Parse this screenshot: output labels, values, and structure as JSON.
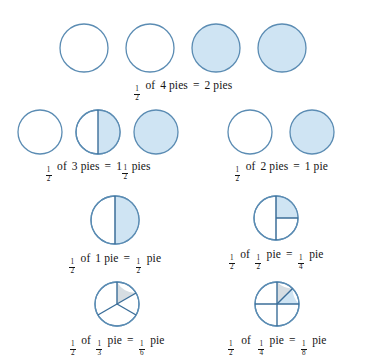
{
  "page": {
    "background_color": "#ffffff",
    "text_color": "#141414"
  },
  "style": {
    "stroke_color": "#5b8cb3",
    "divider_color": "#3b6e99",
    "fill_blue": "#cfe4f3",
    "fill_grey": "#d6dde2"
  },
  "rows": [
    {
      "id": "row-1",
      "caption": {
        "half": {
          "num": "1",
          "den": "2"
        },
        "of": "of",
        "quantity": "4 pies",
        "equals": "=",
        "result": "2 pies"
      },
      "groups": [
        {
          "id": "group-1a",
          "pies": [
            {
              "name": "pie-empty",
              "fill": "none",
              "dividers": []
            },
            {
              "name": "pie-empty",
              "fill": "none",
              "dividers": []
            },
            {
              "name": "pie-full",
              "fill": "blue",
              "dividers": []
            },
            {
              "name": "pie-full",
              "fill": "blue",
              "dividers": []
            }
          ]
        }
      ]
    },
    {
      "id": "row-2",
      "groups": [
        {
          "id": "group-2a",
          "caption": {
            "half": {
              "num": "1",
              "den": "2"
            },
            "of": "of",
            "quantity": "3 pies",
            "equals": "=",
            "result_whole": "1",
            "result_frac": {
              "num": "1",
              "den": "2"
            },
            "result_unit": "pies"
          },
          "pies": [
            {
              "name": "pie-empty",
              "fill": "none",
              "dividers": []
            },
            {
              "name": "pie-half",
              "fill": "right-half",
              "dividers": [
                "vertical"
              ]
            },
            {
              "name": "pie-full",
              "fill": "blue",
              "dividers": []
            }
          ]
        },
        {
          "id": "group-2b",
          "caption": {
            "half": {
              "num": "1",
              "den": "2"
            },
            "of": "of",
            "quantity": "2 pies",
            "equals": "=",
            "result": "1 pie"
          },
          "pies": [
            {
              "name": "pie-empty",
              "fill": "none",
              "dividers": []
            },
            {
              "name": "pie-full",
              "fill": "blue",
              "dividers": []
            }
          ]
        }
      ]
    },
    {
      "id": "row-3",
      "groups": [
        {
          "id": "group-3a",
          "caption": {
            "half": {
              "num": "1",
              "den": "2"
            },
            "of": "of",
            "quantity": "1 pie",
            "equals": "=",
            "result_frac": {
              "num": "1",
              "den": "2"
            },
            "result_unit": "pie"
          },
          "pies": [
            {
              "name": "pie-half-shaded",
              "fill": "right-half",
              "dividers": [
                "vertical"
              ]
            }
          ]
        },
        {
          "id": "group-3b",
          "caption": {
            "half": {
              "num": "1",
              "den": "2"
            },
            "of": "of",
            "quantity_frac": {
              "num": "1",
              "den": "2"
            },
            "quantity_unit": "pie",
            "equals": "=",
            "result_frac": {
              "num": "1",
              "den": "4"
            },
            "result_unit": "pie"
          },
          "pies": [
            {
              "name": "pie-quarter-shaded",
              "fill": "upper-right-quarter",
              "dividers": [
                "vertical",
                "right-horizontal"
              ]
            }
          ]
        }
      ]
    },
    {
      "id": "row-4",
      "groups": [
        {
          "id": "group-4a",
          "caption": {
            "half": {
              "num": "1",
              "den": "2"
            },
            "of": "of",
            "quantity_frac": {
              "num": "1",
              "den": "3"
            },
            "quantity_unit": "pie",
            "equals": "=",
            "result_frac": {
              "num": "1",
              "den": "6"
            },
            "result_unit": "pie"
          },
          "pies": [
            {
              "name": "pie-sixth-shaded",
              "fill": "sixth-wedge",
              "dividers": [
                "thirds",
                "sixth-split"
              ]
            }
          ]
        },
        {
          "id": "group-4b",
          "caption": {
            "half": {
              "num": "1",
              "den": "2"
            },
            "of": "of",
            "quantity_frac": {
              "num": "1",
              "den": "4"
            },
            "quantity_unit": "pie",
            "equals": "=",
            "result_frac": {
              "num": "1",
              "den": "8"
            },
            "result_unit": "pie"
          },
          "pies": [
            {
              "name": "pie-eighth-shaded",
              "fill": "eighth-wedge",
              "dividers": [
                "quarters",
                "eighth-split"
              ]
            }
          ]
        }
      ]
    }
  ]
}
